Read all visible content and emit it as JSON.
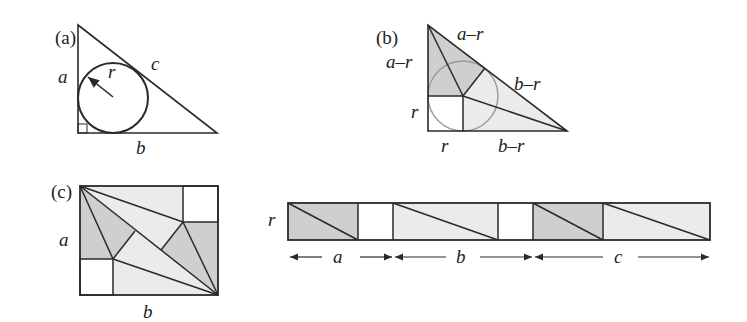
{
  "colors": {
    "stroke": "#2a2a2a",
    "dark_fill": "#cfcfcf",
    "light_fill": "#ebebeb",
    "white": "#ffffff",
    "circle_b": "#9a9a9a"
  },
  "panel_a": {
    "tag": "(a)",
    "labels": {
      "a": "a",
      "b": "b",
      "c": "c",
      "r": "r"
    }
  },
  "panel_b": {
    "tag": "(b)",
    "labels": {
      "top_hyp": "a–r",
      "left_upper": "a–r",
      "right_hyp": "b–r",
      "left_lower": "r",
      "bottom_left": "r",
      "bottom_right": "b–r"
    }
  },
  "panel_c": {
    "tag": "(c)",
    "labels": {
      "a": "a",
      "b": "b"
    }
  },
  "strip": {
    "label_height": "r",
    "segments": [
      {
        "label": "a"
      },
      {
        "label": "b"
      },
      {
        "label": "c"
      }
    ]
  }
}
